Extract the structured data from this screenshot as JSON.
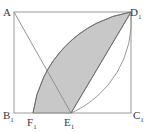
{
  "figure": {
    "colors": {
      "stroke": "#6e6e6e",
      "square_stroke": "#9a9a9a",
      "fill": "#c8c8c8",
      "fill_edge": "#8d8d8d",
      "label": "#3a3a3a",
      "background": "#ffffff"
    },
    "square": {
      "x": 14,
      "y": 12,
      "width": 117,
      "height": 101
    },
    "points": {
      "A": {
        "x": 14,
        "y": 12,
        "label": "A",
        "sub": ""
      },
      "D1": {
        "x": 131,
        "y": 12,
        "label": "D",
        "sub": "1"
      },
      "B1": {
        "x": 14,
        "y": 113,
        "label": "B",
        "sub": "1"
      },
      "C1": {
        "x": 131,
        "y": 113,
        "label": "C",
        "sub": "1"
      },
      "F1": {
        "x": 33,
        "y": 113,
        "label": "F",
        "sub": "1"
      },
      "E1": {
        "x": 71,
        "y": 113,
        "label": "E",
        "sub": "1"
      }
    },
    "segments": [
      {
        "name": "A-E1",
        "from": "A",
        "to": "E1"
      },
      {
        "name": "D1-E1",
        "from": "D1",
        "to": "E1"
      }
    ],
    "arcs": [
      {
        "name": "arc-F1-D1",
        "from": "F1",
        "to": "D1",
        "bulge": "outward-upper-left"
      },
      {
        "name": "arc-E1-D1-outer",
        "from": "E1",
        "to": "D1",
        "bulge": "outward-right"
      }
    ],
    "shaded_region": {
      "name": "lens-F1-D1-E1",
      "description": "Region bounded by arc F1-D1, chord D1-E1 and segment E1-F1"
    }
  }
}
